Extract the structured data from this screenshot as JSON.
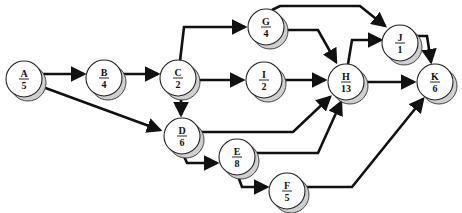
{
  "diagram": {
    "type": "activity-on-node network",
    "nodes": [
      {
        "id": "A",
        "duration": "5",
        "x": 24,
        "y": 79
      },
      {
        "id": "B",
        "duration": "4",
        "x": 104,
        "y": 78
      },
      {
        "id": "C",
        "duration": "2",
        "x": 178,
        "y": 78
      },
      {
        "id": "G",
        "duration": "4",
        "x": 266,
        "y": 27
      },
      {
        "id": "I",
        "duration": "2",
        "x": 264,
        "y": 80
      },
      {
        "id": "D",
        "duration": "6",
        "x": 182,
        "y": 136
      },
      {
        "id": "E",
        "duration": "8",
        "x": 237,
        "y": 157
      },
      {
        "id": "F",
        "duration": "5",
        "x": 287,
        "y": 191
      },
      {
        "id": "H",
        "duration": "13",
        "x": 346,
        "y": 82
      },
      {
        "id": "J",
        "duration": "1",
        "x": 400,
        "y": 43
      },
      {
        "id": "K",
        "duration": "6",
        "x": 435,
        "y": 82
      }
    ],
    "edges": [
      {
        "from": "A",
        "to": "B"
      },
      {
        "from": "A",
        "to": "D"
      },
      {
        "from": "B",
        "to": "C"
      },
      {
        "from": "C",
        "to": "G"
      },
      {
        "from": "C",
        "to": "I"
      },
      {
        "from": "C",
        "to": "D"
      },
      {
        "from": "G",
        "to": "J"
      },
      {
        "from": "G",
        "to": "H"
      },
      {
        "from": "I",
        "to": "H"
      },
      {
        "from": "D",
        "to": "H"
      },
      {
        "from": "D",
        "to": "E"
      },
      {
        "from": "E",
        "to": "H"
      },
      {
        "from": "E",
        "to": "F"
      },
      {
        "from": "F",
        "to": "K"
      },
      {
        "from": "H",
        "to": "J"
      },
      {
        "from": "H",
        "to": "K"
      },
      {
        "from": "J",
        "to": "K"
      }
    ]
  }
}
